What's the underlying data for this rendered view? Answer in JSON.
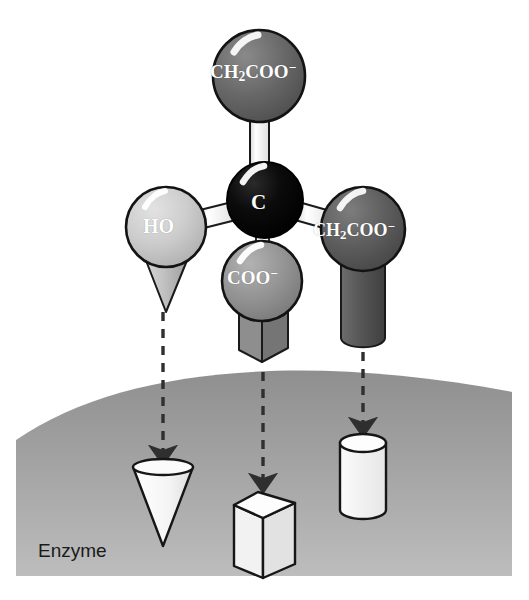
{
  "figure": {
    "background_color": "#ffffff"
  },
  "molecule": {
    "center_atom": {
      "name": "central-carbon",
      "label": "C",
      "color": "#000000",
      "cx": 265,
      "cy": 200,
      "r": 38
    },
    "groups": [
      {
        "id": "top",
        "label_html": "CH<sub>2</sub>COO<sup>−</sup>",
        "label_text": "CH2COO-",
        "color": "#636363",
        "cx": 259,
        "cy": 76,
        "r": 46,
        "tip_shape": "none",
        "has_arrow": false
      },
      {
        "id": "left",
        "label_html": "HO",
        "label_text": "HO",
        "color": "#c8c8c8",
        "cx": 166,
        "cy": 227,
        "r": 40,
        "tip_shape": "cone",
        "has_arrow": true,
        "target_site": "cone-site"
      },
      {
        "id": "bottom",
        "label_html": "COO<sup>−</sup>",
        "label_text": "COO-",
        "color": "#8f8f8f",
        "cx": 262,
        "cy": 281,
        "r": 40,
        "tip_shape": "box",
        "has_arrow": true,
        "target_site": "box-site"
      },
      {
        "id": "right",
        "label_html": "CH<sub>2</sub>COO<sup>−</sup>",
        "label_text": "CH2COO-",
        "color": "#5a5a5a",
        "cx": 363,
        "cy": 229,
        "r": 42,
        "tip_shape": "cylinder",
        "has_arrow": true,
        "target_site": "cylinder-site"
      }
    ],
    "bond_color": "#ffffff",
    "bond_outline": "#1a1a1a"
  },
  "enzyme": {
    "label": "Enzyme",
    "surface_color_top": "#9b9b9b",
    "surface_color_bottom": "#b4b4b4",
    "sites": [
      {
        "id": "cone-site",
        "shape": "cone",
        "cx": 163,
        "cy": 505,
        "color": "#f7f7f7"
      },
      {
        "id": "box-site",
        "shape": "box",
        "cx": 263,
        "cy": 530,
        "color": "#f7f7f7"
      },
      {
        "id": "cylinder-site",
        "shape": "cylinder",
        "cx": 363,
        "cy": 476,
        "color": "#f7f7f7"
      }
    ]
  },
  "arrows": {
    "style": "dashed",
    "color": "#3a3a3a",
    "items": [
      {
        "id": "arrow-left",
        "x": 163,
        "y1": 312,
        "y2": 455
      },
      {
        "id": "arrow-mid",
        "x": 263,
        "y1": 370,
        "y2": 482
      },
      {
        "id": "arrow-right",
        "x": 363,
        "y1": 352,
        "y2": 428
      }
    ]
  }
}
